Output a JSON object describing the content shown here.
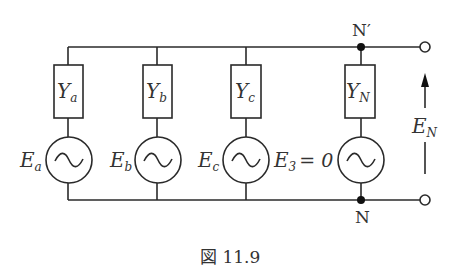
{
  "diagram": {
    "type": "circuit",
    "branches": [
      {
        "admittance_label": "Y",
        "admittance_sub": "a",
        "source_label": "E",
        "source_sub": "a"
      },
      {
        "admittance_label": "Y",
        "admittance_sub": "b",
        "source_label": "E",
        "source_sub": "b"
      },
      {
        "admittance_label": "Y",
        "admittance_sub": "c",
        "source_label": "E",
        "source_sub": "c"
      },
      {
        "admittance_label": "Y",
        "admittance_sub": "N",
        "source_label": "E",
        "source_sub": "3",
        "source_suffix": "= 0"
      }
    ],
    "nodes": {
      "top": "N′",
      "bottom": "N"
    },
    "voltage": {
      "label": "E",
      "sub": "N"
    },
    "caption": "図 11.9"
  }
}
